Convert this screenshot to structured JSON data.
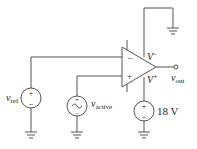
{
  "diagram": {
    "type": "circuit",
    "components": {
      "vref": {
        "label": "v",
        "sub": "ref",
        "kind": "dc-voltage-source",
        "plus": "+",
        "minus": "–"
      },
      "vactive": {
        "label": "v",
        "sub": "active",
        "kind": "ac-voltage-source",
        "plus": "+",
        "minus": "–",
        "symbol": "~"
      },
      "supply": {
        "label": "18 V",
        "kind": "dc-voltage-source",
        "plus": "+",
        "minus": "–"
      },
      "opamp": {
        "inverting": "–",
        "noninverting": "+",
        "vminus": "V",
        "vminus_sup": "–",
        "vplus": "V",
        "vplus_sup": "+"
      },
      "output": {
        "label": "v",
        "sub": "out"
      }
    },
    "colors": {
      "wire": "#555555",
      "text": "#222222"
    }
  }
}
